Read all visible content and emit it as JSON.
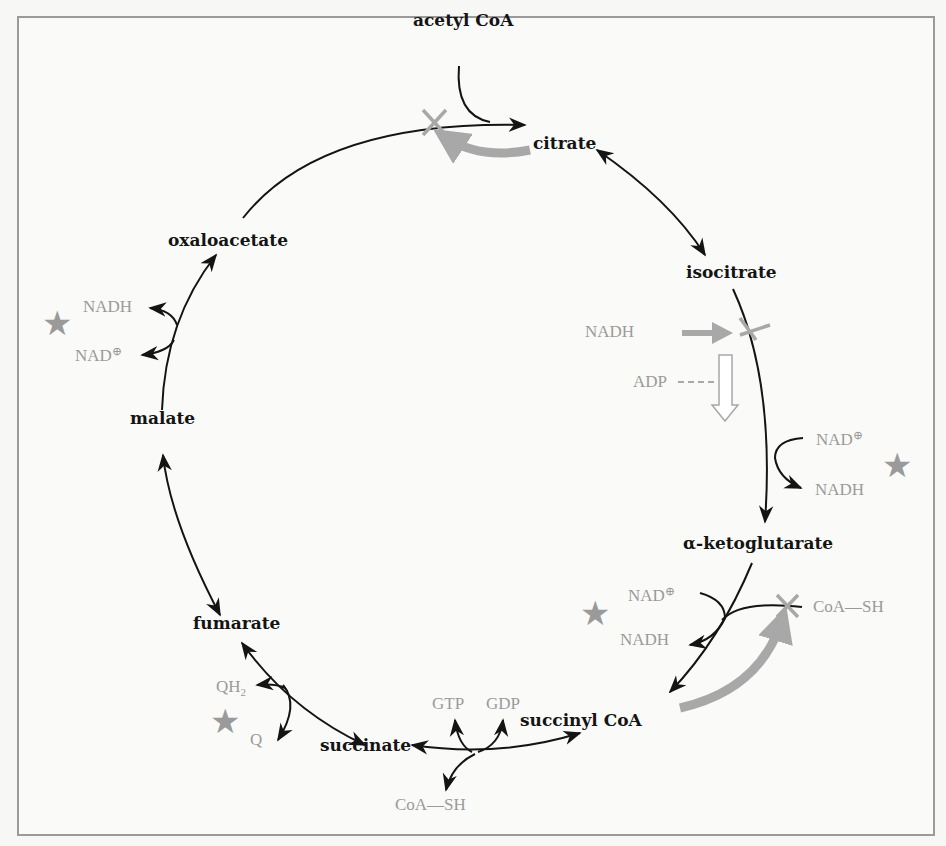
{
  "diagram": {
    "type": "citric acid cycle regulation",
    "metabolites": {
      "acetyl_coa": "acetyl CoA",
      "citrate": "citrate",
      "isocitrate": "isocitrate",
      "alpha_ketoglutarate": "α-ketoglutarate",
      "succinyl_coa": "succinyl CoA",
      "succinate": "succinate",
      "fumarate": "fumarate",
      "malate": "malate",
      "oxaloacetate": "oxaloacetate"
    },
    "cofactors": {
      "isocitrate_step": {
        "in": "NAD",
        "in_sup": "⊕",
        "out": "NADH"
      },
      "akg_step": {
        "in": "NAD",
        "in_sup": "⊕",
        "out": "NADH",
        "coa": "CoA—SH"
      },
      "succinyl_step": {
        "gtp": "GTP",
        "gdp": "GDP",
        "coa": "CoA—SH"
      },
      "succinate_step": {
        "qh2": "QH",
        "qh2_sub": "2",
        "q": "Q"
      },
      "malate_step": {
        "nadh": "NADH",
        "nad": "NAD",
        "nad_sup": "⊕"
      }
    },
    "regulators": {
      "isocitrate_inhibitor": "NADH",
      "isocitrate_activator": "ADP"
    },
    "star_symbol": "★",
    "colors": {
      "pathway": "#141414",
      "regulation": "#9a9a9a",
      "frame": "#9a9a9a",
      "background": "#fafaf8"
    }
  }
}
